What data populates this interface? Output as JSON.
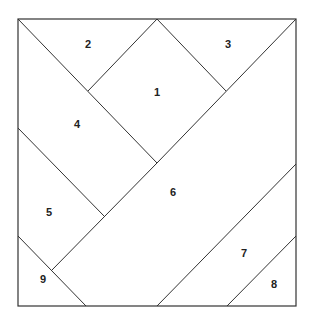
{
  "diagram": {
    "type": "square-dissection",
    "square": {
      "x": 18,
      "y": 19,
      "width": 278,
      "height": 287
    },
    "stroke_color": "#333333",
    "lines": [
      {
        "x1": 18,
        "y1": 19,
        "x2": 157,
        "y2": 163
      },
      {
        "x1": 157,
        "y1": 163,
        "x2": 296,
        "y2": 19
      },
      {
        "x1": 157,
        "y1": 19,
        "x2": 226,
        "y2": 91
      },
      {
        "x1": 157,
        "y1": 19,
        "x2": 88,
        "y2": 91
      },
      {
        "x1": 18,
        "y1": 128,
        "x2": 104,
        "y2": 216
      },
      {
        "x1": 157,
        "y1": 163,
        "x2": 52,
        "y2": 270
      },
      {
        "x1": 18,
        "y1": 236,
        "x2": 86,
        "y2": 306
      },
      {
        "x1": 157,
        "y1": 306,
        "x2": 296,
        "y2": 164
      },
      {
        "x1": 227,
        "y1": 306,
        "x2": 296,
        "y2": 236
      }
    ],
    "labels": [
      {
        "text": "1",
        "x": 157,
        "y": 96
      },
      {
        "text": "2",
        "x": 88,
        "y": 48
      },
      {
        "text": "3",
        "x": 228,
        "y": 48
      },
      {
        "text": "4",
        "x": 77,
        "y": 128
      },
      {
        "text": "5",
        "x": 49,
        "y": 216
      },
      {
        "text": "6",
        "x": 173,
        "y": 196
      },
      {
        "text": "7",
        "x": 244,
        "y": 257
      },
      {
        "text": "8",
        "x": 274,
        "y": 288
      },
      {
        "text": "9",
        "x": 43,
        "y": 283
      }
    ]
  }
}
